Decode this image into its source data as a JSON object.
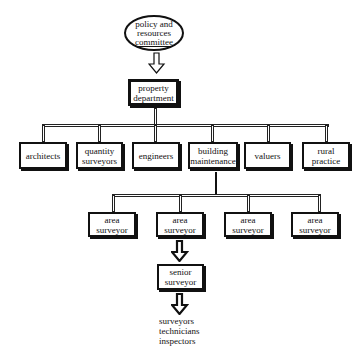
{
  "diagram": {
    "type": "org-chart",
    "root": {
      "label": "policy and\nresources\ncommittee",
      "lines": [
        "policy and",
        "resources",
        "committee"
      ]
    },
    "department": {
      "lines": [
        "property",
        "department"
      ]
    },
    "divisions": [
      {
        "lines": [
          "architects"
        ]
      },
      {
        "lines": [
          "quantity",
          "surveyors"
        ]
      },
      {
        "lines": [
          "engineers"
        ]
      },
      {
        "lines": [
          "building",
          "maintenance"
        ]
      },
      {
        "lines": [
          "valuers"
        ]
      },
      {
        "lines": [
          "rural",
          "practice"
        ]
      }
    ],
    "area_surveyors": [
      {
        "lines": [
          "area",
          "surveyor"
        ]
      },
      {
        "lines": [
          "area",
          "surveyor"
        ]
      },
      {
        "lines": [
          "area",
          "surveyor"
        ]
      },
      {
        "lines": [
          "area",
          "surveyor"
        ]
      }
    ],
    "senior": {
      "lines": [
        "senior",
        "surveyor"
      ]
    },
    "staff": {
      "lines": [
        "surveyors",
        "technicians",
        "inspectors"
      ]
    }
  }
}
